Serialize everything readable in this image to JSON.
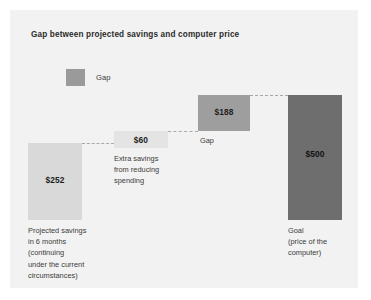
{
  "chart_data": {
    "type": "bar",
    "title": "Gap between projected savings and computer price",
    "xlabel": "",
    "ylabel": "",
    "ylim": [
      0,
      500
    ],
    "grid": false,
    "legend_position": "top-left",
    "legend": [
      {
        "label": "Gap",
        "color": "#9a9a9a"
      }
    ],
    "categories": [
      "Projected savings in 6 months (continuing under the current circumstances)",
      "Extra savings from reducing spending",
      "Gap",
      "Goal (price of the computer)"
    ],
    "values": [
      252,
      60,
      188,
      500
    ],
    "value_labels": [
      "$252",
      "$60",
      "$188",
      "$500"
    ],
    "bars": [
      {
        "id": "projected-savings",
        "value": 252,
        "value_label": "$252",
        "color": "#d9d9d9",
        "caption": "Projected savings in 6 months (continuing under the current circumstances)"
      },
      {
        "id": "extra-savings",
        "value": 60,
        "value_label": "$60",
        "color": "#e4e4e4",
        "caption": "Extra savings from reducing spending"
      },
      {
        "id": "gap",
        "value": 188,
        "value_label": "$188",
        "color": "#9e9e9e",
        "caption": "Gap"
      },
      {
        "id": "goal",
        "value": 500,
        "value_label": "$500",
        "color": "#6e6e6e",
        "caption": "Goal (price of the computer)"
      }
    ],
    "annotations": [
      "Projected savings in 6 months (continuing under the current circumstances)",
      "Extra savings from reducing spending",
      "Gap",
      "Goal (price of the computer)"
    ]
  },
  "card": {
    "background": "#f2f2f2"
  },
  "title": "Gap between projected savings and computer price",
  "legend": {
    "gap_label": "Gap",
    "gap_color": "#9a9a9a"
  },
  "bars": {
    "projected_savings": {
      "value_label": "$252",
      "caption_line_1": "Projected savings",
      "caption_line_2": "in 6 months",
      "caption_line_3": "(continuing",
      "caption_line_4": "under the current",
      "caption_line_5": "circumstances)"
    },
    "extra_savings": {
      "value_label": "$60",
      "caption_line_1": "Extra savings",
      "caption_line_2": "from reducing",
      "caption_line_3": "spending"
    },
    "gap": {
      "value_label": "$188",
      "caption_line_1": "Gap"
    },
    "goal": {
      "value_label": "$500",
      "caption_line_1": "Goal",
      "caption_line_2": "(price of the",
      "caption_line_3": "computer)"
    }
  }
}
